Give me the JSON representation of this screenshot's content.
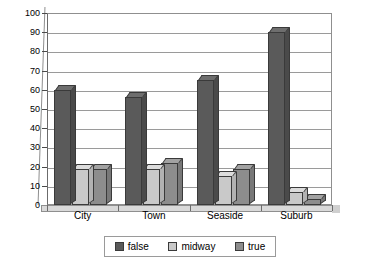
{
  "chart_data": {
    "type": "bar",
    "title": "",
    "xlabel": "",
    "ylabel": "",
    "ylim": [
      0,
      100
    ],
    "ytick_step": 10,
    "grid": true,
    "legend_position": "bottom-center",
    "style": "3d-clustered-column",
    "categories": [
      "City",
      "Town",
      "Seaside",
      "Suburb"
    ],
    "yticks": [
      "100",
      "90",
      "80",
      "70",
      "60",
      "50",
      "40",
      "30",
      "20",
      "10",
      "0"
    ],
    "series": [
      {
        "name": "false",
        "color": "#5a5a5a",
        "values": [
          60,
          56,
          65,
          90
        ]
      },
      {
        "name": "midway",
        "color": "#c9c9c9",
        "values": [
          19,
          19,
          15,
          7
        ]
      },
      {
        "name": "true",
        "color": "#8d8d8d",
        "values": [
          19,
          22,
          19,
          3
        ]
      }
    ]
  },
  "legend": {
    "items": [
      {
        "label": "false",
        "swatch": "legend-swatch-false"
      },
      {
        "label": "midway",
        "swatch": "legend-swatch-midway"
      },
      {
        "label": "true",
        "swatch": "legend-swatch-true"
      }
    ]
  }
}
